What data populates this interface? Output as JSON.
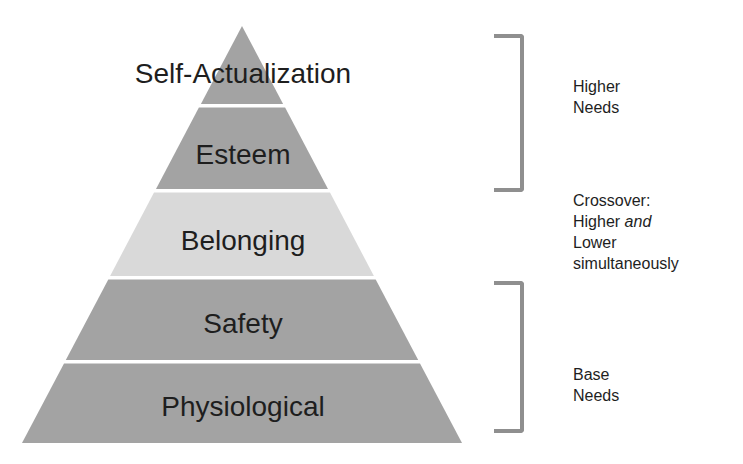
{
  "diagram": {
    "type": "pyramid",
    "layers": [
      {
        "label": "Self-Actualization",
        "fill": "#a3a3a3"
      },
      {
        "label": "Esteem",
        "fill": "#a3a3a3"
      },
      {
        "label": "Belonging",
        "fill": "#d9d9d9"
      },
      {
        "label": "Safety",
        "fill": "#a3a3a3"
      },
      {
        "label": "Physiological",
        "fill": "#a3a3a3"
      }
    ],
    "brackets": [
      {
        "group": "higher",
        "lines": [
          "Higher",
          "Needs"
        ]
      },
      {
        "group": "base",
        "lines": [
          "Base",
          "Needs"
        ]
      }
    ],
    "crossover_note": {
      "line1": "Crossover:",
      "line2_prefix": "Higher ",
      "line2_emphasis": "and",
      "line3": "Lower",
      "line4": "simultaneously"
    },
    "colors": {
      "layer_dark": "#a3a3a3",
      "layer_light": "#d9d9d9",
      "bracket": "#8f8f8f",
      "text": "#1e1e1e"
    }
  }
}
